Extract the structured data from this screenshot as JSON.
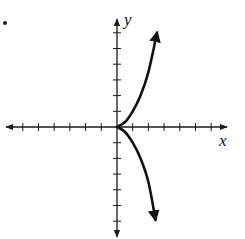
{
  "problem": {
    "marker": "•"
  },
  "chart_data": {
    "type": "line",
    "title": "",
    "xlabel": "x",
    "ylabel": "y",
    "grid": false,
    "xlim": [
      -7,
      7
    ],
    "ylim": [
      -7,
      7
    ],
    "x_ticks": [
      -6,
      -5,
      -4,
      -3,
      -2,
      -1,
      1,
      2,
      3,
      4,
      5,
      6
    ],
    "y_ticks": [
      -6,
      -5,
      -4,
      -3,
      -2,
      -1,
      1,
      2,
      3,
      4,
      5,
      6
    ],
    "tick_labels_shown": false,
    "series": [
      {
        "name": "upper branch",
        "x": [
          0,
          0.5,
          1,
          1.5,
          2,
          2.55
        ],
        "y": [
          0,
          0.3,
          1.0,
          2.0,
          3.5,
          6.0
        ],
        "arrow_end": true
      },
      {
        "name": "lower branch",
        "x": [
          0,
          0.5,
          1,
          1.5,
          2,
          2.45
        ],
        "y": [
          0,
          -0.3,
          -1.0,
          -2.0,
          -3.5,
          -5.9
        ],
        "arrow_end": true
      }
    ],
    "colors": {
      "axis": "#1a1a1a",
      "curve": "#111111"
    }
  }
}
